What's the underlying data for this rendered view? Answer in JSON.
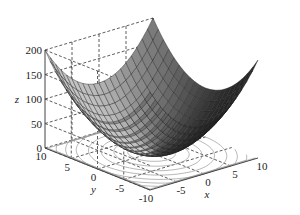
{
  "chart_data": {
    "type": "surface3d",
    "title": "",
    "function": "z = x^2 + y^2",
    "x": {
      "label": "x",
      "range": [
        -10,
        10
      ],
      "ticks": [
        -5,
        0,
        5,
        10
      ],
      "tick_labels": [
        "-5",
        "0",
        "5",
        "10"
      ]
    },
    "y": {
      "label": "y",
      "range": [
        -10,
        10
      ],
      "ticks": [
        -10,
        -5,
        0,
        5,
        10
      ],
      "tick_labels": [
        "-10",
        "-5",
        "0",
        "5",
        "10"
      ]
    },
    "z": {
      "label": "z",
      "range": [
        0,
        200
      ],
      "ticks": [
        0,
        50,
        100,
        150,
        200
      ],
      "tick_labels": [
        "0",
        "50",
        "100",
        "150",
        "200"
      ]
    },
    "grid": true,
    "grid_style": "dashed",
    "mesh_resolution": 21,
    "contour_projection": {
      "on": "z=0 plane",
      "levels": [
        10,
        25,
        45,
        70,
        100,
        130,
        160,
        190
      ]
    },
    "colormap": "grayscale",
    "sample_points": [
      {
        "x": -10,
        "y": -10,
        "z": 200
      },
      {
        "x": 10,
        "y": 10,
        "z": 200
      },
      {
        "x": -10,
        "y": 10,
        "z": 200
      },
      {
        "x": 10,
        "y": -10,
        "z": 200
      },
      {
        "x": 0,
        "y": 0,
        "z": 0
      },
      {
        "x": 10,
        "y": 0,
        "z": 100
      },
      {
        "x": 0,
        "y": 10,
        "z": 100
      },
      {
        "x": 5,
        "y": 5,
        "z": 50
      }
    ]
  },
  "colors": {
    "surface_light": "#d0d0d0",
    "surface_dark": "#1a1a1a",
    "edge": "#222222",
    "grid": "#333333",
    "contour": "#9a9a9a",
    "axis": "#444444"
  }
}
